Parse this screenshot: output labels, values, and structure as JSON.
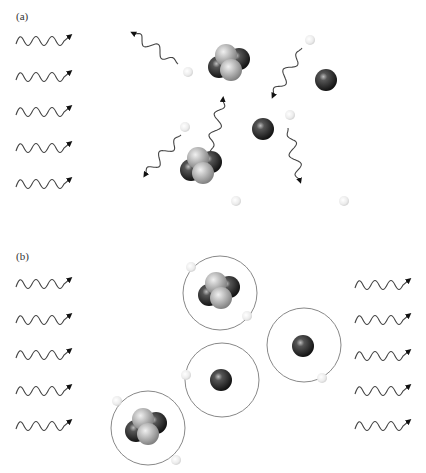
{
  "panels": [
    {
      "id": "a",
      "label": "(a)",
      "label_pos": [
        16,
        10
      ],
      "incoming_waves": [
        [
          16,
          41
        ],
        [
          16,
          77
        ],
        [
          16,
          112
        ],
        [
          16,
          148
        ],
        [
          16,
          184
        ]
      ],
      "outgoing_waves": [],
      "scattered_photons": [
        {
          "from": [
            178,
            64
          ],
          "to": [
            133,
            33
          ]
        },
        {
          "from": [
            302,
            48
          ],
          "to": [
            273,
            96
          ]
        },
        {
          "from": [
            181,
            135
          ],
          "to": [
            145,
            175
          ]
        },
        {
          "from": [
            210,
            152
          ],
          "to": [
            223,
            99
          ]
        },
        {
          "from": [
            288,
            128
          ],
          "to": [
            300,
            181
          ]
        }
      ],
      "electrons": [
        [
          188,
          72
        ],
        [
          310,
          40
        ],
        [
          185,
          127
        ],
        [
          290,
          115
        ],
        [
          236,
          201
        ],
        [
          344,
          201
        ]
      ],
      "single_nuclei": [
        [
          326,
          80
        ],
        [
          263,
          129
        ]
      ],
      "helium_nuclei": [
        [
          228,
          63
        ],
        [
          200,
          166
        ]
      ],
      "orbits": []
    },
    {
      "id": "b",
      "label": "(b)",
      "label_pos": [
        16,
        250
      ],
      "incoming_waves": [
        [
          16,
          284
        ],
        [
          16,
          320
        ],
        [
          16,
          355
        ],
        [
          16,
          391
        ],
        [
          16,
          426
        ]
      ],
      "outgoing_waves": [
        [
          355,
          285
        ],
        [
          355,
          320
        ],
        [
          355,
          356
        ],
        [
          355,
          391
        ],
        [
          355,
          426
        ]
      ],
      "scattered_photons": [],
      "electrons": [],
      "single_nuclei": [
        [
          221,
          380
        ],
        [
          303,
          346
        ]
      ],
      "helium_nuclei": [
        [
          218,
          291
        ],
        [
          145,
          427
        ]
      ],
      "orbits": [
        {
          "center": [
            220,
            293
          ],
          "r": 37,
          "electrons": [
            [
              191,
              267
            ],
            [
              247,
              316
            ]
          ]
        },
        {
          "center": [
            222,
            380
          ],
          "r": 37,
          "electrons": [
            [
              186,
              375
            ]
          ]
        },
        {
          "center": [
            304,
            345
          ],
          "r": 37,
          "electrons": [
            [
              322,
              378
            ]
          ]
        },
        {
          "center": [
            148,
            428
          ],
          "r": 37,
          "electrons": [
            [
              117,
              401
            ],
            [
              176,
              460
            ]
          ]
        }
      ]
    }
  ],
  "colors": {
    "wave": "#444444",
    "orbit": "#888888",
    "proton": "#b8b8b8",
    "neutron": "#222222",
    "electron": "#eeeeee"
  }
}
